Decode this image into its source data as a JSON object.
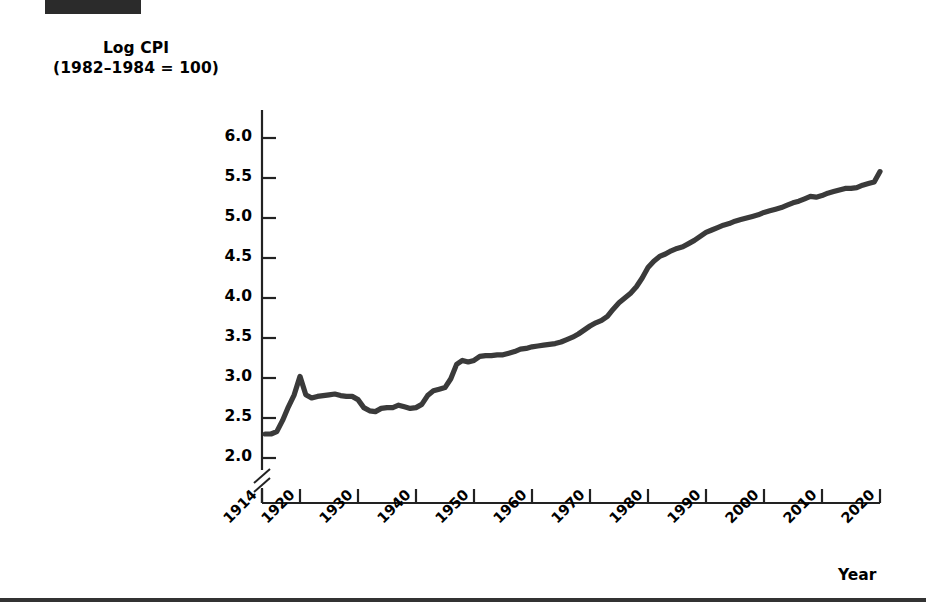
{
  "figure": {
    "redaction_label": "",
    "y_axis_title_line1": "Log CPI",
    "y_axis_title_line2": "(1982–1984 = 100)",
    "x_axis_title": "Year"
  },
  "chart_data": {
    "type": "line",
    "xlabel": "Year",
    "ylabel": "Log CPI (1982-1984 = 100)",
    "xlim": [
      1914,
      2020
    ],
    "ylim": [
      1.95,
      6.1
    ],
    "yticks": [
      "2.0",
      "2.5",
      "3.0",
      "3.5",
      "4.0",
      "4.5",
      "5.0",
      "5.5",
      "6.0"
    ],
    "ytick_values": [
      2.0,
      2.5,
      3.0,
      3.5,
      4.0,
      4.5,
      5.0,
      5.5,
      6.0
    ],
    "xticks": [
      "1914",
      "1920",
      "1930",
      "1940",
      "1950",
      "1960",
      "1970",
      "1980",
      "1990",
      "2000",
      "2010",
      "2020"
    ],
    "xtick_values": [
      1914,
      1920,
      1930,
      1940,
      1950,
      1960,
      1970,
      1980,
      1990,
      2000,
      2010,
      2020
    ],
    "y_axis_break": true,
    "grid": false,
    "legend": null,
    "series": [
      {
        "name": "Log CPI",
        "color": "#3a3a3a",
        "x": [
          1914,
          1915,
          1916,
          1917,
          1918,
          1919,
          1920,
          1921,
          1922,
          1923,
          1924,
          1925,
          1926,
          1927,
          1928,
          1929,
          1930,
          1931,
          1932,
          1933,
          1934,
          1935,
          1936,
          1937,
          1938,
          1939,
          1940,
          1941,
          1942,
          1943,
          1944,
          1945,
          1946,
          1947,
          1948,
          1949,
          1950,
          1951,
          1952,
          1953,
          1954,
          1955,
          1956,
          1957,
          1958,
          1959,
          1960,
          1961,
          1962,
          1963,
          1964,
          1965,
          1966,
          1967,
          1968,
          1969,
          1970,
          1971,
          1972,
          1973,
          1974,
          1975,
          1976,
          1977,
          1978,
          1979,
          1980,
          1981,
          1982,
          1983,
          1984,
          1985,
          1986,
          1987,
          1988,
          1989,
          1990,
          1991,
          1992,
          1993,
          1994,
          1995,
          1996,
          1997,
          1998,
          1999,
          2000,
          2001,
          2002,
          2003,
          2004,
          2005,
          2006,
          2007,
          2008,
          2009,
          2010,
          2011,
          2012,
          2013,
          2014,
          2015,
          2016,
          2017,
          2018,
          2019,
          2020
        ],
        "y": [
          2.3,
          2.3,
          2.33,
          2.47,
          2.64,
          2.79,
          3.02,
          2.79,
          2.75,
          2.77,
          2.78,
          2.79,
          2.8,
          2.78,
          2.77,
          2.77,
          2.73,
          2.63,
          2.59,
          2.58,
          2.62,
          2.63,
          2.63,
          2.66,
          2.64,
          2.62,
          2.63,
          2.67,
          2.78,
          2.84,
          2.86,
          2.88,
          2.99,
          3.17,
          3.22,
          3.2,
          3.22,
          3.27,
          3.28,
          3.28,
          3.29,
          3.29,
          3.31,
          3.33,
          3.36,
          3.37,
          3.39,
          3.4,
          3.41,
          3.42,
          3.43,
          3.45,
          3.48,
          3.51,
          3.55,
          3.6,
          3.65,
          3.69,
          3.72,
          3.77,
          3.86,
          3.94,
          4.0,
          4.06,
          4.14,
          4.25,
          4.38,
          4.46,
          4.52,
          4.55,
          4.59,
          4.62,
          4.64,
          4.68,
          4.72,
          4.77,
          4.82,
          4.85,
          4.88,
          4.91,
          4.93,
          4.96,
          4.98,
          5.0,
          5.02,
          5.04,
          5.07,
          5.09,
          5.11,
          5.13,
          5.16,
          5.19,
          5.21,
          5.24,
          5.27,
          5.26,
          5.28,
          5.31,
          5.33,
          5.35,
          5.37,
          5.37,
          5.38,
          5.41,
          5.43,
          5.45,
          5.58
        ]
      }
    ]
  },
  "geometry": {
    "x_axis_pixel_left": 262,
    "x_axis_pixel_right": 880,
    "y_axis_pixel_top": 110,
    "y_axis_pixel_bottom": 503
  }
}
